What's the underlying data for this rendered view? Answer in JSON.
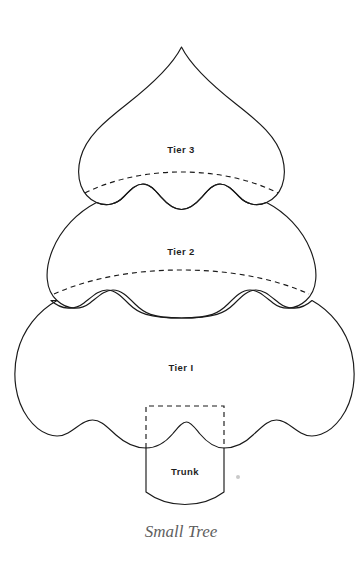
{
  "page": {
    "title": "Small Tree",
    "background_color": "#ffffff",
    "width": 361,
    "height": 567
  },
  "style": {
    "outline_color": "#1a1a1a",
    "label_color": "#1f1f1f",
    "caption_color": "#5f5f5f",
    "speck_color": "#c9c9c9",
    "stroke_width": 1.15,
    "dash_pattern": "5 4"
  },
  "pattern": {
    "name": "Small Tree",
    "pieces": [
      {
        "id": "tier-3",
        "label": "Tier 3",
        "label_x": 181,
        "label_y": 153,
        "scallops": 3,
        "has_seam_line": true
      },
      {
        "id": "tier-2",
        "label": "Tier 2",
        "label_x": 181,
        "label_y": 255,
        "scallops": 3,
        "has_seam_line": true
      },
      {
        "id": "tier-1",
        "label": "Tier I",
        "label_x": 181,
        "label_y": 371,
        "scallops": 4,
        "has_seam_line": false
      },
      {
        "id": "trunk",
        "label": "Trunk",
        "label_x": 185,
        "label_y": 475,
        "scallops": 0,
        "has_seam_line": false
      }
    ]
  },
  "caption": {
    "text": "Small Tree",
    "x": 181,
    "y": 537
  },
  "artifact": {
    "name": "scan-speck",
    "x": 238,
    "y": 477,
    "radius": 2
  }
}
